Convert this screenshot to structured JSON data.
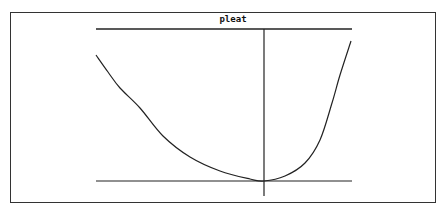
{
  "chart_data": {
    "type": "line",
    "title": "pleat",
    "xlabel": "",
    "ylabel": "",
    "grid": false,
    "legend": null,
    "series": [
      {
        "name": "curve",
        "points_px": [
          [
            96,
            55
          ],
          [
            108,
            72
          ],
          [
            120,
            88
          ],
          [
            140,
            108
          ],
          [
            163,
            136
          ],
          [
            190,
            157
          ],
          [
            220,
            171
          ],
          [
            250,
            179
          ],
          [
            264,
            181
          ],
          [
            285,
            176
          ],
          [
            305,
            163
          ],
          [
            320,
            140
          ],
          [
            332,
            103
          ],
          [
            340,
            75
          ],
          [
            351,
            41
          ]
        ]
      }
    ],
    "axes": {
      "vertical_axis_x_px": 264,
      "top_line_y_px": 29,
      "bottom_line_y_px": 181,
      "x_range_px": [
        96,
        352
      ]
    },
    "colors": {
      "line": "#222222",
      "background": "#ffffff",
      "frame": "#333333"
    }
  }
}
